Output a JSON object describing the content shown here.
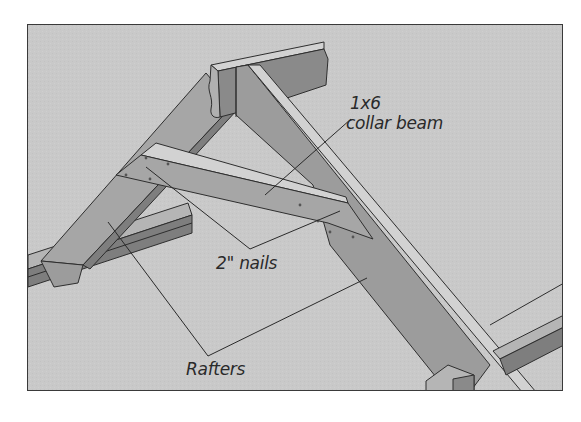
{
  "figure": {
    "background_color": "#c9c9c9",
    "frame_border_color": "#3a3a3a",
    "lumber_colors": {
      "face_light": "#b5b5b5",
      "face_mid": "#9c9c9c",
      "face_dark": "#7e7e7e",
      "edge_highlight": "#d2d2d2",
      "outline": "#2e2e2e"
    },
    "components": [
      "ridge-board",
      "left-rafter",
      "right-rafter",
      "collar-beam",
      "left-wall-plate",
      "right-wall-plate",
      "post-block"
    ]
  },
  "callouts": {
    "collar_beam": {
      "line1": "1x6",
      "line2": "collar beam"
    },
    "nails": {
      "label": "2\" nails"
    },
    "rafters": {
      "label": "Rafters"
    }
  }
}
